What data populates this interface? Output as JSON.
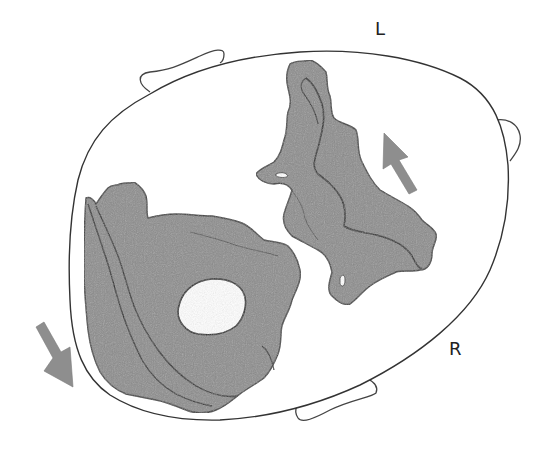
{
  "figure": {
    "type": "anatomical-cross-section-diagram",
    "labels": {
      "left": "L",
      "right": "R"
    },
    "colors": {
      "outline": "#333333",
      "fragment_fill": "#8c8c8c",
      "fragment_stroke": "#3a3a3a",
      "arrow_fill": "#8e8e8e",
      "background": "#ffffff"
    },
    "elements": {
      "outer_outline": "oval contour",
      "tabs": [
        "top-left tab",
        "right tab",
        "bottom tab"
      ],
      "fragments": [
        "upper-right fragment",
        "lower-left fragment with central hole"
      ],
      "arrows": [
        {
          "name": "arrow-up-left",
          "direction": "up-left"
        },
        {
          "name": "arrow-down-right",
          "direction": "down-right"
        }
      ]
    }
  }
}
